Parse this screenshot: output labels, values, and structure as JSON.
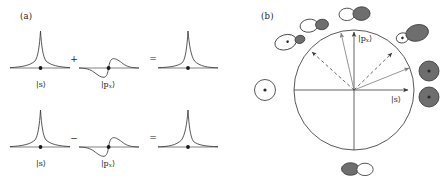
{
  "figure": {
    "width": 448,
    "height": 185,
    "background": "#ffffff",
    "stroke_color": "#3a3a3a",
    "lobe_fill_gray": "#6e6e6e",
    "lobe_fill_white": "#ffffff",
    "arrow_gray": "#7a7a7a"
  },
  "panel_a": {
    "label": "(a)",
    "rows": [
      {
        "operator": "+",
        "terms": [
          {
            "name": "s-orbital-wavefunction",
            "ket": "|s⟩",
            "base": "s",
            "sub": ""
          },
          {
            "name": "px-orbital-wavefunction",
            "ket": "|p",
            "base": "p",
            "sub": "x"
          }
        ],
        "equals": "=",
        "result": {
          "name": "hybrid-orbital-right",
          "ket": ""
        }
      },
      {
        "operator": "−",
        "terms": [
          {
            "name": "s-orbital-wavefunction",
            "ket": "|s⟩",
            "base": "s",
            "sub": ""
          },
          {
            "name": "px-orbital-wavefunction",
            "ket": "|p",
            "base": "p",
            "sub": "x"
          }
        ],
        "equals": "=",
        "result": {
          "name": "hybrid-orbital-left",
          "ket": ""
        }
      }
    ],
    "ket_s": "|s⟩",
    "ket_px_open": "|p",
    "ket_px_sub": "x",
    "ket_px_close": "⟩",
    "plus": "+",
    "minus": "−",
    "equals": "="
  },
  "panel_b": {
    "label": "(b)",
    "axis_labels": {
      "vertical_open": "|p",
      "vertical_sub": "x",
      "vertical_close": "⟩",
      "horizontal": "|s⟩"
    },
    "circle": {
      "cx": 354,
      "cy": 90,
      "r": 60
    },
    "solid_arrows": [
      {
        "name": "arrow-s-axis",
        "angle_deg": 0,
        "length": 60,
        "color": "#3a3a3a"
      },
      {
        "name": "arrow-px-axis",
        "angle_deg": 90,
        "length": 60,
        "color": "#3a3a3a"
      },
      {
        "name": "arrow-hybrid-45",
        "angle_deg": 22,
        "length": 60,
        "color": "#7a7a7a"
      },
      {
        "name": "arrow-hybrid-75",
        "angle_deg": 78,
        "length": 60,
        "color": "#7a7a7a"
      }
    ],
    "dashed_arrows": [
      {
        "name": "dashed-arrow-50",
        "angle_deg": 50,
        "length": 60
      },
      {
        "name": "dashed-arrow-130",
        "angle_deg": 130,
        "length": 60
      }
    ],
    "orbitals": [
      {
        "name": "orbital-s-pure-left",
        "x": 265,
        "y": 90,
        "angle_deg": 180,
        "type": "s"
      },
      {
        "name": "orbital-hybrid-135",
        "x": 286,
        "y": 40,
        "angle_deg": 155,
        "type": "hybrid-small"
      },
      {
        "name": "orbital-hybrid-110",
        "x": 312,
        "y": 23,
        "angle_deg": 125,
        "type": "hybrid-mid"
      },
      {
        "name": "orbital-hybrid-95",
        "x": 353,
        "y": 12,
        "angle_deg": 100,
        "type": "hybrid-large"
      },
      {
        "name": "orbital-hybrid-35",
        "x": 408,
        "y": 35,
        "angle_deg": 20,
        "type": "hybrid-large"
      },
      {
        "name": "orbital-p-right-upper",
        "x": 428,
        "y": 72,
        "angle_deg": 0,
        "type": "p-dot"
      },
      {
        "name": "orbital-p-right-lower",
        "x": 428,
        "y": 98,
        "angle_deg": 0,
        "type": "p-dot"
      },
      {
        "name": "orbital-hybrid-bottom",
        "x": 358,
        "y": 168,
        "angle_deg": 0,
        "type": "hybrid-flip"
      }
    ]
  }
}
